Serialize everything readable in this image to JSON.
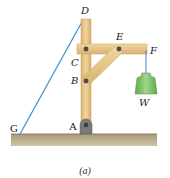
{
  "figure": {
    "caption": "(a)",
    "labels": {
      "A": "A",
      "B": "B",
      "C": "C",
      "D": "D",
      "E": "E",
      "F": "F",
      "G": "G",
      "W": "W"
    },
    "colors": {
      "wood": "#e8c98c",
      "wood_edge": "#c9a05c",
      "cable": "#3a8fc9",
      "ground": "#b5a684",
      "ground_edge": "#8c7d5c",
      "weight": "#7fbf6a",
      "pin": "#4a4a4a",
      "support": "#7a7a7a"
    }
  }
}
